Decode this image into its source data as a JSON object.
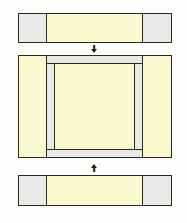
{
  "figure": {
    "canvas": {
      "width": 187,
      "height": 223,
      "background": "#fdfdfb"
    },
    "palette": {
      "cream": "#fbf8cd",
      "gray": "#e9e9e7",
      "outline": "#2b2a20",
      "arrow": "#1d1d18",
      "background": "#fdfdfb"
    },
    "parts": [
      {
        "id": "top-plate",
        "label": "Top plate",
        "position": {
          "x": 18,
          "y": 13,
          "width": 154,
          "height": 30
        },
        "segments": [
          {
            "id": "top-plate-left-pad",
            "label": "Left pad",
            "material": "gray",
            "x": 18,
            "y": 13,
            "width": 29,
            "height": 30
          },
          {
            "id": "top-plate-center-web",
            "label": "Center web",
            "material": "cream",
            "x": 46,
            "y": 13,
            "width": 97,
            "height": 30
          },
          {
            "id": "top-plate-right-pad",
            "label": "Right pad",
            "material": "gray",
            "x": 142,
            "y": 13,
            "width": 30,
            "height": 30
          }
        ]
      },
      {
        "id": "middle-frame",
        "label": "Middle frame",
        "position": {
          "x": 18,
          "y": 55,
          "width": 154,
          "height": 103
        },
        "segments": [
          {
            "id": "middle-frame-left-post",
            "label": "Left post",
            "material": "cream",
            "x": 18,
            "y": 55,
            "width": 29,
            "height": 103
          },
          {
            "id": "middle-frame-right-post",
            "label": "Right post",
            "material": "cream",
            "x": 142,
            "y": 55,
            "width": 30,
            "height": 103
          },
          {
            "id": "middle-frame-top-rail",
            "label": "Top rail",
            "material": "gray",
            "x": 46,
            "y": 55,
            "width": 97,
            "height": 9
          },
          {
            "id": "middle-frame-bottom-rail",
            "label": "Bottom rail",
            "material": "gray",
            "x": 46,
            "y": 149,
            "width": 97,
            "height": 9
          },
          {
            "id": "middle-frame-left-spacer",
            "label": "Left spacer",
            "material": "gray",
            "x": 46,
            "y": 63,
            "width": 9,
            "height": 87
          },
          {
            "id": "middle-frame-right-spacer",
            "label": "Right spacer",
            "material": "gray",
            "x": 134,
            "y": 63,
            "width": 9,
            "height": 87
          },
          {
            "id": "middle-frame-core",
            "label": "Core panel",
            "material": "cream",
            "x": 54,
            "y": 63,
            "width": 81,
            "height": 87
          }
        ]
      },
      {
        "id": "bottom-plate",
        "label": "Bottom plate",
        "position": {
          "x": 18,
          "y": 175,
          "width": 154,
          "height": 31
        },
        "segments": [
          {
            "id": "bottom-plate-left-pad",
            "label": "Left pad",
            "material": "gray",
            "x": 18,
            "y": 175,
            "width": 29,
            "height": 31
          },
          {
            "id": "bottom-plate-center-web",
            "label": "Center web",
            "material": "cream",
            "x": 46,
            "y": 175,
            "width": 97,
            "height": 31
          },
          {
            "id": "bottom-plate-right-pad",
            "label": "Right pad",
            "material": "gray",
            "x": 142,
            "y": 175,
            "width": 30,
            "height": 31
          }
        ]
      }
    ],
    "arrows": [
      {
        "id": "arrow-top-to-middle",
        "label": "Assembly direction: top plate onto middle frame",
        "direction": "down",
        "x": 94,
        "y": 45,
        "length": 9
      },
      {
        "id": "arrow-bottom-to-middle",
        "label": "Assembly direction: bottom plate onto middle frame",
        "direction": "up",
        "x": 94,
        "y": 162,
        "length": 10
      }
    ]
  }
}
